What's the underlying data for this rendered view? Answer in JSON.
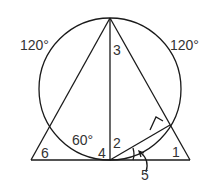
{
  "figure": {
    "labels": {
      "arc_left": "120°",
      "arc_right": "120°",
      "angle_inner_left": "60°",
      "angle_1": "1",
      "angle_2": "2",
      "angle_3": "3",
      "angle_4": "4",
      "angle_5": "5",
      "angle_6": "6"
    },
    "colors": {
      "line": "#1a1a1a",
      "text": "#333333",
      "background": "#ffffff"
    }
  }
}
